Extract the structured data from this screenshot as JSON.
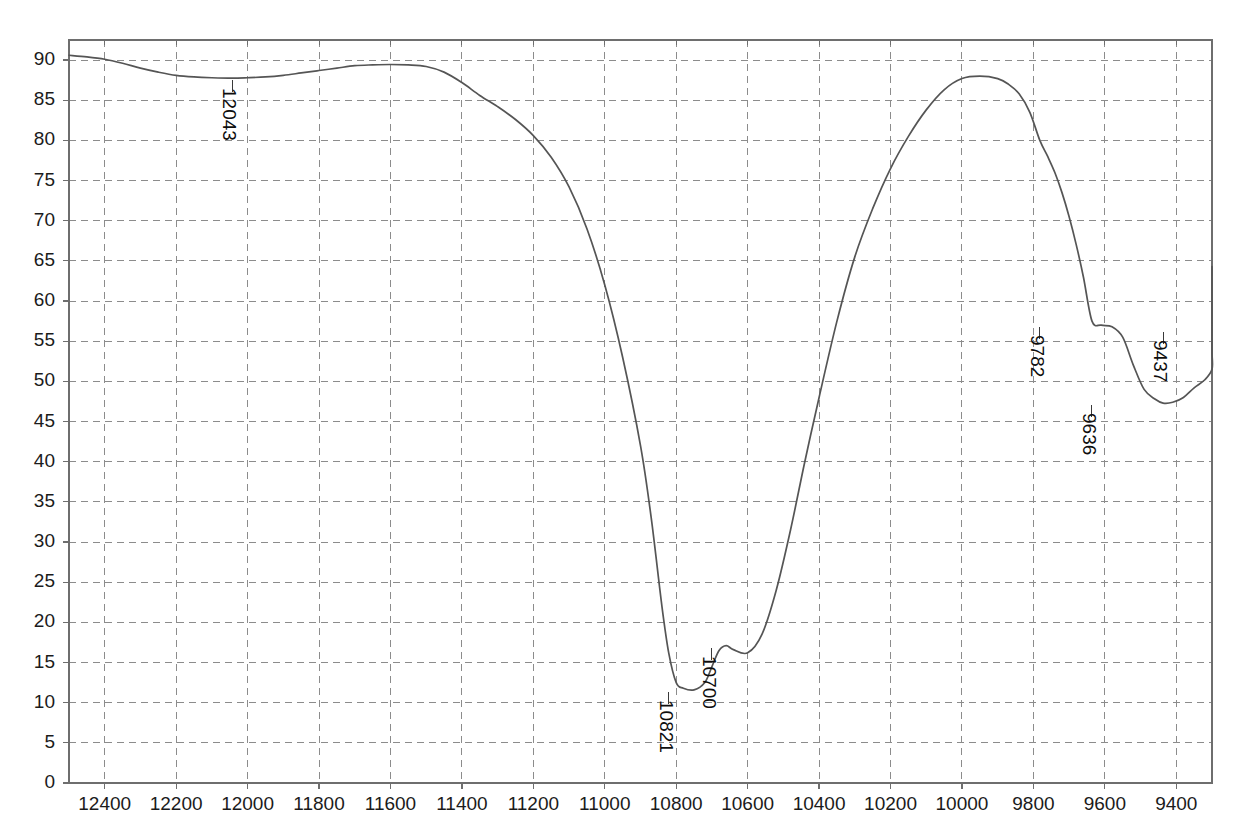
{
  "chart_data": {
    "type": "line",
    "title": "",
    "subtitle": "",
    "xlabel": "",
    "ylabel": "",
    "grid": true,
    "legend_position": "none",
    "xlim": [
      12500,
      9300
    ],
    "ylim": [
      0,
      92.5
    ],
    "x_axis_direction": "reversed",
    "xticks": [
      12400,
      12200,
      12000,
      11800,
      11600,
      11400,
      11200,
      11000,
      10800,
      10600,
      10400,
      10200,
      10000,
      9800,
      9600,
      9400
    ],
    "yticks": [
      0,
      5,
      10,
      15,
      20,
      25,
      30,
      35,
      40,
      45,
      50,
      55,
      60,
      65,
      70,
      75,
      80,
      85,
      90
    ],
    "series": [
      {
        "name": "transmittance",
        "color": "#555555",
        "x": [
          12500,
          12450,
          12400,
          12350,
          12300,
          12250,
          12200,
          12150,
          12100,
          12043,
          12000,
          11950,
          11900,
          11850,
          11800,
          11750,
          11700,
          11650,
          11600,
          11550,
          11500,
          11450,
          11400,
          11350,
          11300,
          11250,
          11200,
          11150,
          11100,
          11050,
          11000,
          10950,
          10900,
          10870,
          10840,
          10821,
          10800,
          10780,
          10750,
          10720,
          10700,
          10680,
          10660,
          10640,
          10600,
          10560,
          10520,
          10480,
          10440,
          10400,
          10350,
          10300,
          10250,
          10200,
          10150,
          10100,
          10050,
          10000,
          9950,
          9900,
          9870,
          9840,
          9810,
          9782,
          9760,
          9740,
          9720,
          9700,
          9680,
          9660,
          9636,
          9610,
          9580,
          9550,
          9520,
          9490,
          9460,
          9437,
          9410,
          9380,
          9350,
          9320,
          9300
        ],
        "y": [
          90.6,
          90.4,
          90.1,
          89.6,
          89.0,
          88.5,
          88.1,
          87.9,
          87.8,
          87.75,
          87.8,
          87.9,
          88.1,
          88.4,
          88.7,
          89.0,
          89.3,
          89.4,
          89.45,
          89.4,
          89.2,
          88.5,
          87.2,
          85.6,
          84.2,
          82.6,
          80.6,
          77.9,
          74.2,
          69.0,
          62.0,
          53.0,
          42.0,
          33.0,
          22.0,
          16.2,
          12.5,
          11.8,
          11.6,
          12.5,
          14.5,
          16.5,
          17.1,
          16.6,
          16.2,
          18.5,
          24.0,
          31.5,
          40.0,
          48.0,
          57.5,
          65.5,
          71.5,
          76.5,
          80.5,
          83.8,
          86.3,
          87.7,
          88.0,
          87.7,
          87.0,
          85.8,
          83.5,
          80.0,
          78.0,
          76.0,
          73.5,
          70.5,
          67.0,
          63.0,
          57.5,
          57.0,
          56.8,
          55.5,
          52.0,
          49.0,
          47.8,
          47.3,
          47.4,
          48.0,
          49.2,
          50.2,
          51.5
        ],
        "y_continued": [
          53.5,
          55.2,
          56.3,
          56.6,
          56.2,
          56.0,
          56.5,
          58.0,
          60.0,
          61.8,
          63.2,
          64.0,
          64.3
        ]
      }
    ],
    "annotations": [
      {
        "label": "12043",
        "x": 12043,
        "y": 87.75
      },
      {
        "label": "10821",
        "x": 10821,
        "y": 11.6
      },
      {
        "label": "10700",
        "x": 10700,
        "y": 17.1
      },
      {
        "label": "9782",
        "x": 9782,
        "y": 57.0
      },
      {
        "label": "9636",
        "x": 9636,
        "y": 47.3
      },
      {
        "label": "9437",
        "x": 9437,
        "y": 56.4
      }
    ],
    "styles": {
      "grid_color": "#8c8c8c",
      "axis_color": "#6e6e6e",
      "curve_color": "#555555",
      "text_color": "#1b1b1b",
      "background": "#ffffff"
    }
  },
  "axis": {
    "y_labels": [
      "90",
      "85",
      "80",
      "75",
      "70",
      "65",
      "60",
      "55",
      "50",
      "45",
      "40",
      "35",
      "30",
      "25",
      "20",
      "15",
      "10",
      "5",
      "0"
    ],
    "x_labels": [
      "12400",
      "12200",
      "12000",
      "11800",
      "11600",
      "11400",
      "11200",
      "11000",
      "10800",
      "10600",
      "10400",
      "10200",
      "10000",
      "9800",
      "9600",
      "9400"
    ]
  },
  "peaks": {
    "p1": "12043",
    "p2": "10821",
    "p3": "10700",
    "p4": "9782",
    "p5": "9636",
    "p6": "9437"
  }
}
